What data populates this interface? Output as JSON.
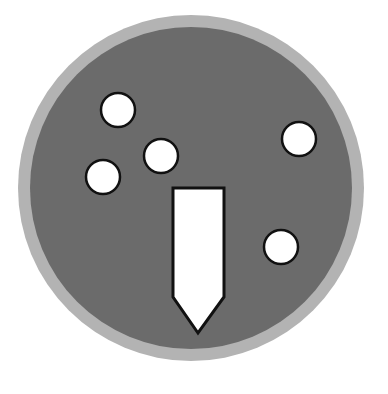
{
  "figure": {
    "colors": {
      "background": "#ffffff",
      "outer_ring": "#b3b3b3",
      "inner_disc": "#6b6b6b",
      "shape_fill": "#ffffff",
      "shape_stroke": "#111111"
    },
    "dish": {
      "cx": 191,
      "cy": 188,
      "outer_r": 173,
      "inner_r": 161
    },
    "dots": [
      {
        "cx": 118,
        "cy": 110,
        "r": 17
      },
      {
        "cx": 299,
        "cy": 139,
        "r": 17
      },
      {
        "cx": 161,
        "cy": 156,
        "r": 17
      },
      {
        "cx": 103,
        "cy": 177,
        "r": 17
      },
      {
        "cx": 281,
        "cy": 247,
        "r": 17
      }
    ],
    "pointer": {
      "points": "173,188 224,188 224,297 198,333 173,297"
    }
  }
}
